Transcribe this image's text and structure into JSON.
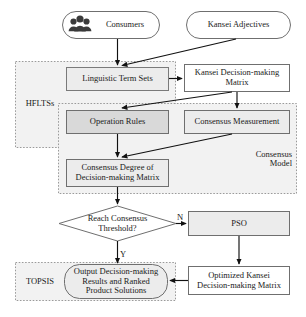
{
  "figure": {
    "type": "flowchart"
  },
  "nodes": {
    "consumers": {
      "label": "Consumers",
      "shape": "rounded-terminator",
      "icon": "people-group-icon"
    },
    "kansei_adjectives": {
      "label": "Kansei Adjectives",
      "shape": "rounded-terminator"
    },
    "linguistic_term_sets": {
      "label": "Linguistic Term Sets",
      "shape": "rectangle"
    },
    "kansei_decision_matrix": {
      "label": "Kansei Decision-making\nMatrix",
      "shape": "rectangle"
    },
    "operation_rules": {
      "label": "Operation Rules",
      "shape": "rectangle"
    },
    "consensus_measurement": {
      "label": "Consensus Measurement",
      "shape": "rectangle"
    },
    "consensus_degree": {
      "label": "Consensus Degree of\nDecision-making Matrix",
      "shape": "rectangle"
    },
    "decision": {
      "label": "Reach Consensus\nThreshold?",
      "shape": "diamond"
    },
    "pso": {
      "label": "PSO",
      "shape": "rectangle"
    },
    "optimized_matrix": {
      "label": "Optimized Kansei\nDecision-making Matrix",
      "shape": "rectangle"
    },
    "output": {
      "label": "Output Decision-making\nResults and Ranked\nProduct Solutions",
      "shape": "rounded-terminator"
    }
  },
  "groups": {
    "hflts": {
      "label": "HFLTSs",
      "style": "dashed"
    },
    "consensus_model": {
      "label": "Consensus\nModel",
      "style": "dashed"
    },
    "topsis": {
      "label": "TOPSIS",
      "style": "dashed"
    }
  },
  "edge_labels": {
    "no": "N",
    "yes": "Y"
  },
  "colors": {
    "node_fill": "#ececec",
    "node_stroke": "#7a7a7a",
    "group_fill": "#f2f2f2",
    "group_stroke": "#9a9a9a",
    "arrow": "#111111",
    "text": "#1a1a1a"
  }
}
